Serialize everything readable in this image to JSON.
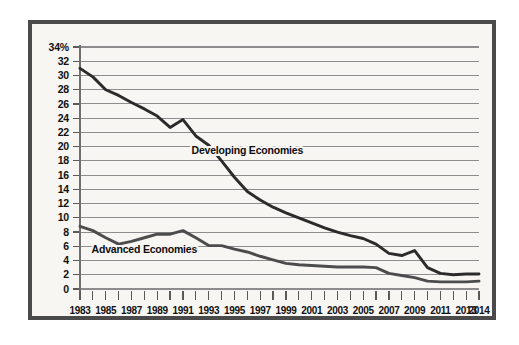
{
  "figure": {
    "frame_color": "#4a4a4a",
    "background_color": "#f7f6f3",
    "gridline_color": "#8d8d8d"
  },
  "chart_data": {
    "type": "line",
    "title": "",
    "subtitle": "",
    "xlabel": "",
    "ylabel": "",
    "ylim": [
      0,
      34
    ],
    "xlim": [
      1983,
      2014
    ],
    "grid": true,
    "legend_position": "inline-annotations",
    "y_axis_unit": "%",
    "y_tick_labels": [
      "34%",
      "32",
      "30",
      "28",
      "26",
      "24",
      "22",
      "20",
      "18",
      "16",
      "14",
      "12",
      "10",
      "8",
      "6",
      "4",
      "2",
      "0"
    ],
    "y_tick_values": [
      34,
      32,
      30,
      28,
      26,
      24,
      22,
      20,
      18,
      16,
      14,
      12,
      10,
      8,
      6,
      4,
      2,
      0
    ],
    "x_tick_values": [
      1983,
      1984,
      1985,
      1986,
      1987,
      1988,
      1989,
      1990,
      1991,
      1992,
      1993,
      1994,
      1995,
      1996,
      1997,
      1998,
      1999,
      2000,
      2001,
      2002,
      2003,
      2004,
      2005,
      2006,
      2007,
      2008,
      2009,
      2010,
      2011,
      2012,
      2013,
      2014
    ],
    "x_tick_labels_shown": [
      "1983",
      "1985",
      "1987",
      "1989",
      "1991",
      "1993",
      "1995",
      "1997",
      "1999",
      "2001",
      "2003",
      "2005",
      "2007",
      "2009",
      "2011",
      "2013",
      "2014"
    ],
    "x": [
      1983,
      1984,
      1985,
      1986,
      1987,
      1988,
      1989,
      1990,
      1991,
      1992,
      1993,
      1994,
      1995,
      1996,
      1997,
      1998,
      1999,
      2000,
      2001,
      2002,
      2003,
      2004,
      2005,
      2006,
      2007,
      2008,
      2009,
      2010,
      2011,
      2012,
      2013,
      2014
    ],
    "series": [
      {
        "name": "Developing Economies",
        "color": "#2b2b2b",
        "annotation_x": 1996,
        "annotation_y": 19.0,
        "values": [
          31.0,
          29.8,
          28.0,
          27.2,
          26.2,
          25.3,
          24.3,
          22.7,
          23.8,
          21.5,
          20.2,
          18.0,
          15.7,
          13.7,
          12.5,
          11.5,
          10.7,
          10.0,
          9.3,
          8.6,
          8.0,
          7.5,
          7.1,
          6.3,
          5.0,
          4.7,
          5.4,
          3.0,
          2.2,
          2.0,
          2.1,
          2.1
        ]
      },
      {
        "name": "Advanced Economies",
        "color": "#4c4c4c",
        "annotation_x": 1988,
        "annotation_y": 5.0,
        "values": [
          8.8,
          8.2,
          7.2,
          6.3,
          6.7,
          7.2,
          7.7,
          7.7,
          8.2,
          7.2,
          6.1,
          6.1,
          5.6,
          5.2,
          4.6,
          4.1,
          3.6,
          3.4,
          3.3,
          3.2,
          3.1,
          3.1,
          3.1,
          3.0,
          2.2,
          1.9,
          1.6,
          1.1,
          1.0,
          1.0,
          1.0,
          1.1
        ]
      }
    ]
  }
}
